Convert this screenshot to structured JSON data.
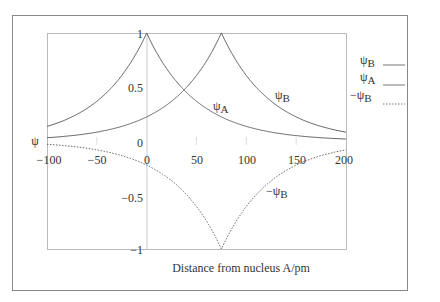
{
  "chart_data": {
    "type": "line",
    "title": "",
    "xlabel": "Distance from nucleus A/pm",
    "ylabel": "ψ",
    "xlim": [
      -100,
      200
    ],
    "ylim": [
      -1,
      1
    ],
    "x_ticks": [
      "-100",
      "-50",
      "0",
      "50",
      "100",
      "150",
      "200"
    ],
    "y_ticks": [
      "1",
      "0.5",
      "0",
      "-0.5",
      "-1"
    ],
    "grid": false,
    "legend_position": "right-outside",
    "series": [
      {
        "name": "ψA",
        "style": "solid",
        "peak_x": 0,
        "peak_y": 1,
        "decay_pm": 50,
        "x": [
          -100,
          -50,
          0,
          37.5,
          75,
          100,
          150,
          200
        ],
        "values": [
          0.14,
          0.37,
          1.0,
          0.47,
          0.22,
          0.14,
          0.05,
          0.02
        ]
      },
      {
        "name": "ψB",
        "style": "solid",
        "peak_x": 75,
        "peak_y": 1,
        "decay_pm": 50,
        "x": [
          -100,
          -50,
          0,
          37.5,
          75,
          100,
          150,
          200
        ],
        "values": [
          0.03,
          0.08,
          0.22,
          0.47,
          1.0,
          0.61,
          0.22,
          0.08
        ]
      },
      {
        "name": "-ψB",
        "style": "dashed",
        "peak_x": 75,
        "peak_y": -1,
        "decay_pm": 50,
        "x": [
          -100,
          -50,
          0,
          37.5,
          75,
          100,
          150,
          200
        ],
        "values": [
          -0.03,
          -0.08,
          -0.22,
          -0.47,
          -1.0,
          -0.61,
          -0.22,
          -0.08
        ]
      }
    ],
    "annotations": [
      {
        "text": "ψA",
        "x": 35,
        "y": 0.27
      },
      {
        "text": "ψB",
        "x": 105,
        "y": 0.37
      },
      {
        "text": "-ψB",
        "x": 110,
        "y": -0.48
      }
    ]
  },
  "legend": {
    "items": [
      {
        "label": "ψ",
        "sub": "B",
        "style": "solid"
      },
      {
        "label": "ψ",
        "sub": "A",
        "style": "solid"
      },
      {
        "label": "−ψ",
        "sub": "B",
        "style": "dashed"
      }
    ]
  },
  "axes": {
    "y_axis_symbol": "ψ",
    "xlabel": "Distance from nucleus A/pm",
    "x_ticks": [
      "−100",
      "−50",
      "0",
      "50",
      "100",
      "150",
      "200"
    ],
    "y_ticks": [
      "1",
      "0.5",
      "0",
      "−0.5",
      "−1"
    ]
  },
  "curve_labels": {
    "psiA": {
      "sym": "ψ",
      "sub": "A"
    },
    "psiB": {
      "sym": "ψ",
      "sub": "B"
    },
    "negPsiB": {
      "sym": "−ψ",
      "sub": "B"
    }
  }
}
